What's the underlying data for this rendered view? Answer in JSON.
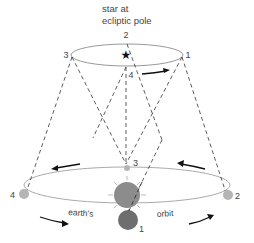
{
  "title": {
    "line1": "star at",
    "line2": "ecliptic pole"
  },
  "star_orbit_labels": {
    "p1": "1",
    "p2": "2",
    "p3": "3",
    "p4": "4"
  },
  "earth_labels": {
    "p1": "1",
    "p2": "2",
    "p3": "3",
    "p4": "4"
  },
  "orbit_label": {
    "left": "earth's",
    "right": "orbit"
  },
  "colors": {
    "ellipse_stroke": "#999999",
    "dash": "#333333",
    "sun": "#8c8c8c",
    "earth_near": "#6e6e6e",
    "earth_far": "#b5b5b5",
    "arrow": "#111111",
    "text": "#444444"
  }
}
